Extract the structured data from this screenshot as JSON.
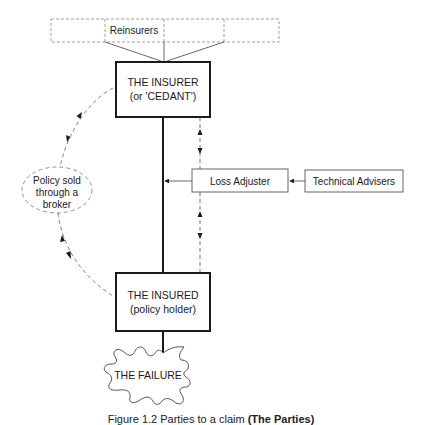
{
  "diagram": {
    "reinsurers": {
      "label": "Reinsurers",
      "cells": 4
    },
    "insurer": {
      "line1": "THE INSURER",
      "line2": "(or 'CEDANT')"
    },
    "insured": {
      "line1": "THE INSURED",
      "line2": "(policy holder)"
    },
    "broker": {
      "line1": "Policy sold",
      "line2": "through a",
      "line3": "broker"
    },
    "loss_adjuster": {
      "label": "Loss Adjuster"
    },
    "technical_advisers": {
      "label": "Technical Advisers"
    },
    "failure": {
      "label": "THE FAILURE"
    }
  },
  "caption": {
    "prefix": "Figure 1.2  Parties to a claim",
    "bold": "(The Parties)"
  },
  "colors": {
    "stroke": "#1a1a1a",
    "dashed": "#777777",
    "background": "#ffffff"
  }
}
